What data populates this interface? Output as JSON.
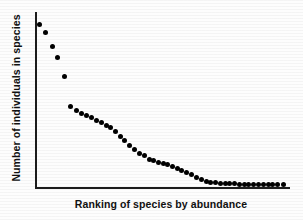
{
  "chart_data": {
    "type": "scatter",
    "title": "",
    "subtitle": "",
    "xlabel": "Ranking of species by  abundance",
    "ylabel": "Number of individuals in species",
    "grid": false,
    "legend": null,
    "xticks": [],
    "yticks": [],
    "xlim": [
      0,
      52
    ],
    "ylim": [
      0,
      100
    ],
    "axis_note": "Axes are unlabeled: left and bottom spines only, no tick marks and no numeric tick labels.",
    "marker": {
      "shape": "circle",
      "filled": true,
      "color": "#000000",
      "size_px": 5
    },
    "series": [
      {
        "name": "species abundance",
        "x": [
          1,
          2,
          3,
          4,
          5,
          6,
          7,
          8,
          9,
          10,
          11,
          12,
          13,
          14,
          15,
          16,
          17,
          18,
          19,
          20,
          21,
          22,
          23,
          24,
          25,
          26,
          27,
          28,
          29,
          30,
          31,
          32,
          33,
          34,
          35,
          36,
          37,
          38,
          39,
          40,
          41,
          42,
          43,
          44,
          45,
          46,
          47,
          48,
          49,
          50
        ],
        "values": [
          93,
          88,
          80,
          74,
          64,
          47,
          45,
          43,
          42,
          41,
          39,
          38,
          36,
          35,
          33,
          30,
          28,
          25,
          23,
          21,
          20,
          18,
          17,
          16,
          16,
          15,
          14,
          13,
          12,
          11,
          10,
          8,
          7,
          6,
          5,
          5,
          4,
          4,
          4,
          4,
          3,
          3,
          3,
          3,
          3,
          3,
          3,
          3,
          3,
          3
        ]
      }
    ],
    "points_px": [
      [
        39,
        24
      ],
      [
        45,
        32
      ],
      [
        52,
        46
      ],
      [
        57,
        57
      ],
      [
        64,
        76
      ],
      [
        70,
        106
      ],
      [
        76,
        110
      ],
      [
        81,
        113
      ],
      [
        86,
        115
      ],
      [
        91,
        117
      ],
      [
        96,
        120
      ],
      [
        101,
        122
      ],
      [
        106,
        125
      ],
      [
        110,
        127
      ],
      [
        115,
        131
      ],
      [
        120,
        136
      ],
      [
        124,
        140
      ],
      [
        129,
        145
      ],
      [
        134,
        149
      ],
      [
        139,
        153
      ],
      [
        144,
        155
      ],
      [
        149,
        159
      ],
      [
        153,
        160
      ],
      [
        158,
        162
      ],
      [
        163,
        163
      ],
      [
        167,
        164
      ],
      [
        172,
        166
      ],
      [
        177,
        168
      ],
      [
        181,
        170
      ],
      [
        186,
        172
      ],
      [
        191,
        174
      ],
      [
        196,
        177
      ],
      [
        201,
        179
      ],
      [
        206,
        181
      ],
      [
        210,
        182
      ],
      [
        215,
        182
      ],
      [
        220,
        183
      ],
      [
        225,
        183
      ],
      [
        229,
        183
      ],
      [
        234,
        183
      ],
      [
        239,
        184
      ],
      [
        244,
        184
      ],
      [
        248,
        184
      ],
      [
        253,
        184
      ],
      [
        258,
        184
      ],
      [
        263,
        184
      ],
      [
        268,
        184
      ],
      [
        272,
        184
      ],
      [
        277,
        184
      ],
      [
        283,
        184
      ]
    ]
  }
}
